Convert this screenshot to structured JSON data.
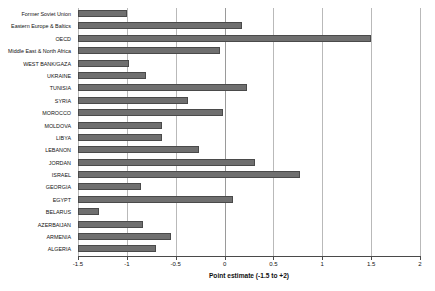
{
  "chart_data": {
    "type": "bar",
    "orientation": "horizontal",
    "title": "",
    "xlabel": "Point estimate (-1.5 to +2)",
    "ylabel": "",
    "xlim": [
      -1.5,
      2
    ],
    "xticks": [
      -1.5,
      -1,
      -0.5,
      0,
      0.5,
      1,
      1.5,
      2
    ],
    "xtick_labels": [
      "-1.5",
      "-1",
      "-0.5",
      "0",
      "0.5",
      "1",
      "1.5",
      "2"
    ],
    "grid": true,
    "legend": false,
    "bar_color": "#6f6f6f",
    "bar_edge_color": "#4a4a4a",
    "categories": [
      "Former Soviet Union",
      "Eastern Europe & Baltics",
      "OECD",
      "Middle East & North Africa",
      "WEST BANK/GAZA",
      "UKRAINE",
      "TUNISIA",
      "SYRIA",
      "MOROCCO",
      "MOLDOVA",
      "LIBYA",
      "LEBANON",
      "JORDAN",
      "ISRAEL",
      "GEORGIA",
      "EGYPT",
      "BELARUS",
      "AZERBAIJAN",
      "ARMENIA",
      "ALGERIA"
    ],
    "values": [
      -1.0,
      0.18,
      1.5,
      -0.05,
      -0.98,
      -0.8,
      0.23,
      -0.37,
      -0.02,
      -0.64,
      -0.64,
      -0.26,
      0.31,
      0.77,
      -0.86,
      0.09,
      -1.28,
      -0.83,
      -0.55,
      -0.7
    ]
  },
  "caption": {
    "text": ""
  }
}
